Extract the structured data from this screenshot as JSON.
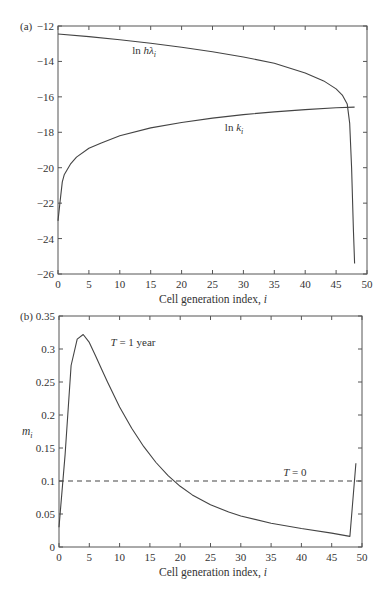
{
  "chart_data": [
    {
      "panel": "(a)",
      "type": "line",
      "title": "",
      "xlabel": "Cell generation index, i",
      "ylabel": "",
      "xlim": [
        0,
        50
      ],
      "ylim": [
        -26,
        -12
      ],
      "xticks": [
        0,
        5,
        10,
        15,
        20,
        25,
        30,
        35,
        40,
        45,
        50
      ],
      "yticks": [
        -12,
        -14,
        -16,
        -18,
        -20,
        -22,
        -24,
        -26
      ],
      "grid": false,
      "legend": "none (inline labels)",
      "series": [
        {
          "name": "ln hλ_i",
          "label_main": "ln h",
          "label_greek": "λ",
          "label_sub": "i",
          "label_pos": [
            12,
            -13.6
          ],
          "x": [
            0,
            5,
            10,
            15,
            20,
            25,
            30,
            35,
            40,
            43,
            45,
            46,
            46.8,
            47.2,
            47.5,
            47.8,
            48
          ],
          "y": [
            -12.45,
            -12.6,
            -12.78,
            -12.97,
            -13.2,
            -13.45,
            -13.75,
            -14.1,
            -14.65,
            -15.1,
            -15.55,
            -15.9,
            -16.4,
            -17.5,
            -20.0,
            -23.5,
            -25.4
          ]
        },
        {
          "name": "ln k_i",
          "label_main": "ln k",
          "label_greek": "",
          "label_sub": "i",
          "label_pos": [
            27,
            -17.9
          ],
          "x": [
            0,
            0.3,
            0.7,
            1,
            2,
            3,
            5,
            7,
            10,
            15,
            20,
            25,
            30,
            35,
            40,
            45,
            48
          ],
          "y": [
            -23.0,
            -22.0,
            -20.8,
            -20.4,
            -19.8,
            -19.4,
            -18.9,
            -18.6,
            -18.2,
            -17.75,
            -17.45,
            -17.2,
            -17.0,
            -16.85,
            -16.72,
            -16.62,
            -16.58
          ]
        }
      ]
    },
    {
      "panel": "(b)",
      "type": "line",
      "title": "",
      "xlabel": "Cell generation index, i",
      "ylabel": "m_i",
      "ylabel_main": "m",
      "ylabel_sub": "i",
      "xlim": [
        0,
        50
      ],
      "ylim": [
        0,
        0.35
      ],
      "xticks": [
        0,
        5,
        10,
        15,
        20,
        25,
        30,
        35,
        40,
        45,
        50
      ],
      "yticks": [
        0,
        0.05,
        0.1,
        0.15,
        0.2,
        0.25,
        0.3,
        0.35
      ],
      "grid": false,
      "legend": "none (inline labels)",
      "series": [
        {
          "name": "T = 1 year",
          "label": "T = 1 year",
          "label_pos": [
            8.5,
            0.305
          ],
          "style": "solid",
          "x": [
            0,
            1,
            2,
            3,
            4,
            5,
            6,
            7,
            8,
            10,
            12,
            14,
            16,
            18,
            20,
            22,
            25,
            28,
            30,
            35,
            40,
            45,
            48,
            49
          ],
          "y": [
            0.03,
            0.14,
            0.275,
            0.315,
            0.322,
            0.31,
            0.29,
            0.27,
            0.25,
            0.212,
            0.18,
            0.152,
            0.128,
            0.108,
            0.092,
            0.079,
            0.064,
            0.053,
            0.047,
            0.036,
            0.028,
            0.021,
            0.016,
            0.127
          ]
        },
        {
          "name": "T = 0",
          "label": "T = 0",
          "label_pos": [
            37,
            0.107
          ],
          "style": "dashed",
          "x": [
            0,
            50
          ],
          "y": [
            0.1,
            0.1
          ]
        }
      ]
    }
  ]
}
